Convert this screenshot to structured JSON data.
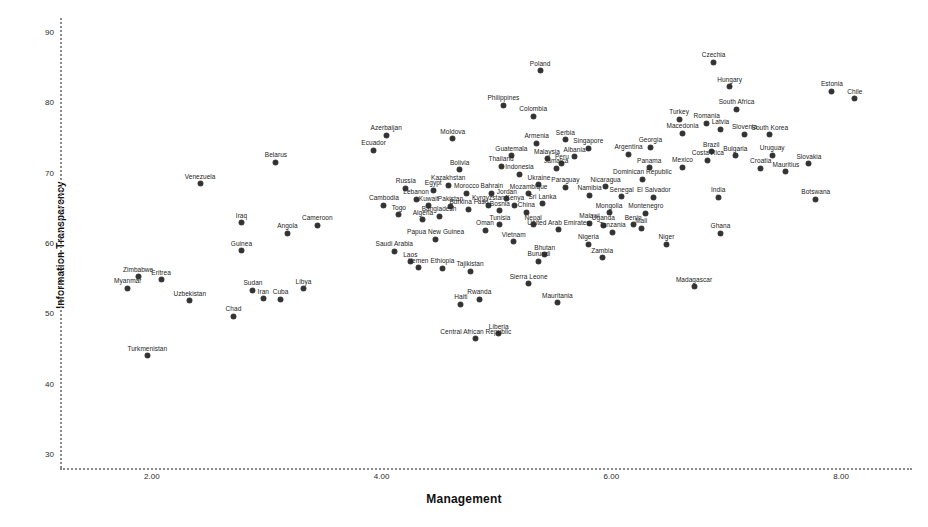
{
  "chart_data": {
    "type": "scatter",
    "title": "",
    "xlabel": "Management",
    "ylabel": "Information Transparency",
    "xlim": [
      1.2,
      8.6
    ],
    "ylim": [
      28.0,
      92.0
    ],
    "xticks": [
      "2.00",
      "4.00",
      "6.00",
      "8.00"
    ],
    "xtickvalues": [
      2.0,
      4.0,
      6.0,
      8.0
    ],
    "yticks": [
      "90",
      "80",
      "70",
      "60",
      "50",
      "40",
      "30"
    ],
    "ytickvalues": [
      90,
      80,
      70,
      60,
      50,
      40,
      30
    ],
    "grid": false,
    "legend": false,
    "point_label_field": "country",
    "points": [
      {
        "country": "Poland",
        "x": 5.38,
        "y": 84.5
      },
      {
        "country": "Czechia",
        "x": 6.89,
        "y": 85.7
      },
      {
        "country": "Hungary",
        "x": 7.03,
        "y": 82.2
      },
      {
        "country": "Estonia",
        "x": 7.92,
        "y": 81.6
      },
      {
        "country": "Chile",
        "x": 8.12,
        "y": 80.5
      },
      {
        "country": "South Africa",
        "x": 7.09,
        "y": 79.0
      },
      {
        "country": "Philippines",
        "x": 5.06,
        "y": 79.6
      },
      {
        "country": "Colombia",
        "x": 5.32,
        "y": 78.0
      },
      {
        "country": "Turkey",
        "x": 6.59,
        "y": 77.6
      },
      {
        "country": "Romania",
        "x": 6.83,
        "y": 77.0
      },
      {
        "country": "Latvia",
        "x": 6.95,
        "y": 76.2
      },
      {
        "country": "Macedonia",
        "x": 6.62,
        "y": 75.6
      },
      {
        "country": "Slovenia",
        "x": 7.16,
        "y": 75.5
      },
      {
        "country": "South Korea",
        "x": 7.38,
        "y": 75.4
      },
      {
        "country": "Azerbaijan",
        "x": 4.04,
        "y": 75.3
      },
      {
        "country": "Moldova",
        "x": 4.62,
        "y": 74.8
      },
      {
        "country": "Serbia",
        "x": 5.6,
        "y": 74.7
      },
      {
        "country": "Armenia",
        "x": 5.35,
        "y": 74.2
      },
      {
        "country": "Singapore",
        "x": 5.8,
        "y": 73.5
      },
      {
        "country": "Georgia",
        "x": 6.34,
        "y": 73.6
      },
      {
        "country": "Ecuador",
        "x": 3.93,
        "y": 73.2
      },
      {
        "country": "Brazil",
        "x": 6.87,
        "y": 73.0
      },
      {
        "country": "Argentina",
        "x": 6.15,
        "y": 72.6
      },
      {
        "country": "Bulgaria",
        "x": 7.08,
        "y": 72.4
      },
      {
        "country": "Uruguay",
        "x": 7.4,
        "y": 72.5
      },
      {
        "country": "Costa Rica",
        "x": 6.84,
        "y": 71.8
      },
      {
        "country": "Albania",
        "x": 5.68,
        "y": 72.3
      },
      {
        "country": "Guatemala",
        "x": 5.13,
        "y": 72.4
      },
      {
        "country": "Malaysia",
        "x": 5.44,
        "y": 72.0
      },
      {
        "country": "Slovakia",
        "x": 7.72,
        "y": 71.3
      },
      {
        "country": "Peru",
        "x": 5.57,
        "y": 71.3
      },
      {
        "country": "Jamaica",
        "x": 5.52,
        "y": 70.6
      },
      {
        "country": "Mexico",
        "x": 6.62,
        "y": 70.8
      },
      {
        "country": "Panama",
        "x": 6.33,
        "y": 70.7
      },
      {
        "country": "Croatia",
        "x": 7.3,
        "y": 70.6
      },
      {
        "country": "Mauritius",
        "x": 7.52,
        "y": 70.1
      },
      {
        "country": "Thailand",
        "x": 5.04,
        "y": 70.9
      },
      {
        "country": "Belarus",
        "x": 3.08,
        "y": 71.5
      },
      {
        "country": "Bolivia",
        "x": 4.68,
        "y": 70.4
      },
      {
        "country": "Indonesia",
        "x": 5.2,
        "y": 69.8
      },
      {
        "country": "Dominican Republic",
        "x": 6.27,
        "y": 69.1
      },
      {
        "country": "Venezuela",
        "x": 2.42,
        "y": 68.4
      },
      {
        "country": "Nicaragua",
        "x": 5.95,
        "y": 68.0
      },
      {
        "country": "Kazakhstan",
        "x": 4.58,
        "y": 68.2
      },
      {
        "country": "Ukraine",
        "x": 5.37,
        "y": 68.3
      },
      {
        "country": "Paraguay",
        "x": 5.6,
        "y": 67.9
      },
      {
        "country": "Russia",
        "x": 4.21,
        "y": 67.8
      },
      {
        "country": "Egypt",
        "x": 4.45,
        "y": 67.5
      },
      {
        "country": "Morocco",
        "x": 4.74,
        "y": 67.1
      },
      {
        "country": "Bahrain",
        "x": 4.96,
        "y": 67.1
      },
      {
        "country": "Mozambique",
        "x": 5.28,
        "y": 67.0
      },
      {
        "country": "Namibia",
        "x": 5.81,
        "y": 66.8
      },
      {
        "country": "Senegal",
        "x": 6.09,
        "y": 66.6
      },
      {
        "country": "El Salvador",
        "x": 6.37,
        "y": 66.5
      },
      {
        "country": "India",
        "x": 6.93,
        "y": 66.5
      },
      {
        "country": "Botswana",
        "x": 7.78,
        "y": 66.2
      },
      {
        "country": "Lebanon",
        "x": 4.3,
        "y": 66.2
      },
      {
        "country": "Jordan",
        "x": 5.09,
        "y": 66.3
      },
      {
        "country": "Sri Lanka",
        "x": 5.4,
        "y": 65.6
      },
      {
        "country": "Kyrgyzstan",
        "x": 4.93,
        "y": 65.4
      },
      {
        "country": "Kenya",
        "x": 5.16,
        "y": 65.4
      },
      {
        "country": "Cambodia",
        "x": 4.02,
        "y": 65.4
      },
      {
        "country": "Kuwait",
        "x": 4.41,
        "y": 65.3
      },
      {
        "country": "Pakistan",
        "x": 4.6,
        "y": 65.2
      },
      {
        "country": "Burkina Faso",
        "x": 4.76,
        "y": 64.8
      },
      {
        "country": "Bosnia",
        "x": 5.03,
        "y": 64.6
      },
      {
        "country": "China",
        "x": 5.26,
        "y": 64.4
      },
      {
        "country": "Mongolia",
        "x": 5.98,
        "y": 64.3
      },
      {
        "country": "Montenegro",
        "x": 6.3,
        "y": 64.2
      },
      {
        "country": "Togo",
        "x": 4.15,
        "y": 64.0
      },
      {
        "country": "Bangladesh",
        "x": 4.5,
        "y": 63.8
      },
      {
        "country": "Algeria",
        "x": 4.36,
        "y": 63.3
      },
      {
        "country": "Iraq",
        "x": 2.78,
        "y": 62.9
      },
      {
        "country": "Cameroon",
        "x": 3.44,
        "y": 62.5
      },
      {
        "country": "Tunisia",
        "x": 5.03,
        "y": 62.6
      },
      {
        "country": "Nepal",
        "x": 5.32,
        "y": 62.6
      },
      {
        "country": "Malawi",
        "x": 5.81,
        "y": 62.8
      },
      {
        "country": "Uganda",
        "x": 5.93,
        "y": 62.5
      },
      {
        "country": "Benin",
        "x": 6.19,
        "y": 62.6
      },
      {
        "country": "Mali",
        "x": 6.26,
        "y": 62.1
      },
      {
        "country": "Oman",
        "x": 4.9,
        "y": 61.8
      },
      {
        "country": "United Arab Emirates",
        "x": 5.54,
        "y": 61.9
      },
      {
        "country": "Tanzania",
        "x": 6.01,
        "y": 61.5
      },
      {
        "country": "Ghana",
        "x": 6.95,
        "y": 61.4
      },
      {
        "country": "Angola",
        "x": 3.18,
        "y": 61.4
      },
      {
        "country": "Papua New Guinea",
        "x": 4.47,
        "y": 60.5
      },
      {
        "country": "Vietnam",
        "x": 5.15,
        "y": 60.2
      },
      {
        "country": "Nigeria",
        "x": 5.8,
        "y": 59.8
      },
      {
        "country": "Niger",
        "x": 6.48,
        "y": 59.8
      },
      {
        "country": "Guinea",
        "x": 2.78,
        "y": 58.9
      },
      {
        "country": "Saudi Arabia",
        "x": 4.11,
        "y": 58.8
      },
      {
        "country": "Bhutan",
        "x": 5.42,
        "y": 58.3
      },
      {
        "country": "Zambia",
        "x": 5.92,
        "y": 57.9
      },
      {
        "country": "Laos",
        "x": 4.25,
        "y": 57.3
      },
      {
        "country": "Burundi",
        "x": 5.37,
        "y": 57.4
      },
      {
        "country": "Yemen",
        "x": 4.32,
        "y": 56.5
      },
      {
        "country": "Ethiopia",
        "x": 4.53,
        "y": 56.4
      },
      {
        "country": "Tajikistan",
        "x": 4.77,
        "y": 56.0
      },
      {
        "country": "Zimbabwe",
        "x": 1.88,
        "y": 55.2
      },
      {
        "country": "Eritrea",
        "x": 2.08,
        "y": 54.8
      },
      {
        "country": "Myanmar",
        "x": 1.79,
        "y": 53.6
      },
      {
        "country": "Sierra Leone",
        "x": 5.28,
        "y": 54.2
      },
      {
        "country": "Madagascar",
        "x": 6.72,
        "y": 53.8
      },
      {
        "country": "Sudan",
        "x": 2.88,
        "y": 53.3
      },
      {
        "country": "Libya",
        "x": 3.32,
        "y": 53.5
      },
      {
        "country": "Iran",
        "x": 2.97,
        "y": 52.1
      },
      {
        "country": "Cuba",
        "x": 3.12,
        "y": 52.0
      },
      {
        "country": "Uzbekistan",
        "x": 2.33,
        "y": 51.8
      },
      {
        "country": "Rwanda",
        "x": 4.85,
        "y": 52.0
      },
      {
        "country": "Haiti",
        "x": 4.69,
        "y": 51.3
      },
      {
        "country": "Mauritania",
        "x": 5.53,
        "y": 51.5
      },
      {
        "country": "Chad",
        "x": 2.71,
        "y": 49.6
      },
      {
        "country": "Liberia",
        "x": 5.02,
        "y": 47.1
      },
      {
        "country": "Central African Republic",
        "x": 4.82,
        "y": 46.4
      },
      {
        "country": "Turkmenistan",
        "x": 1.96,
        "y": 44.0
      }
    ]
  },
  "colors": {
    "point": "#333333",
    "axis": "#8a8a8a",
    "text": "#1a1a1a",
    "background": "#ffffff"
  }
}
